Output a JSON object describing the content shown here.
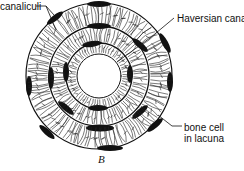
{
  "diagram": {
    "labels": {
      "canaliculi": "canaliculi",
      "haversian_canal": "Haversian canal",
      "bone_cell_line1": "bone cell",
      "bone_cell_line2": "in lacuna"
    },
    "figure_label": "B",
    "geometry": {
      "center": [
        99,
        76
      ],
      "outer_radius": 73,
      "ring_radii": [
        73,
        50,
        33
      ],
      "canal_radius": 22
    },
    "colors": {
      "ink": "#111111",
      "background": "#ffffff"
    }
  }
}
